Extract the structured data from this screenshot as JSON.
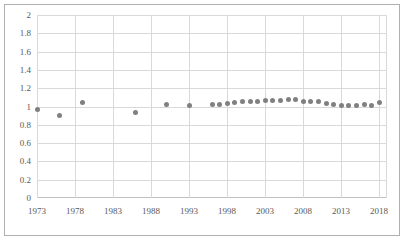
{
  "chart_data": {
    "type": "scatter",
    "title": "",
    "xlabel": "",
    "ylabel": "",
    "xlim": [
      1973,
      2019
    ],
    "ylim": [
      0,
      2
    ],
    "grid": true,
    "legend": "none",
    "marker_color": "#808080",
    "gridline_color": "#d9d9d9",
    "tick_label_color": "#595959",
    "frame_color": "#b0b0b0",
    "yticks": [
      "0",
      "0.2",
      "0.4",
      "0.6",
      "0.8",
      "1",
      "1.2",
      "1.4",
      "1.6",
      "1.8",
      "2"
    ],
    "ytick_values": [
      0,
      0.2,
      0.4,
      0.6,
      0.8,
      1.0,
      1.2,
      1.4,
      1.6,
      1.8,
      2.0
    ],
    "xticks": [
      "1973",
      "1978",
      "1983",
      "1988",
      "1993",
      "1998",
      "2003",
      "2008",
      "2013",
      "2018"
    ],
    "xtick_values": [
      1973,
      1978,
      1983,
      1988,
      1993,
      1998,
      2003,
      2008,
      2013,
      2018
    ],
    "series": [
      {
        "name": "series-1",
        "color": "#808080",
        "x": [
          1973,
          1976,
          1979,
          1986,
          1990,
          1993,
          1996,
          1997,
          1998,
          1999,
          2000,
          2001,
          2002,
          2003,
          2004,
          2005,
          2006,
          2007,
          2008,
          2009,
          2010,
          2011,
          2012,
          2013,
          2014,
          2015,
          2016,
          2017,
          2018
        ],
        "y": [
          0.97,
          0.9,
          1.04,
          0.93,
          1.02,
          1.01,
          1.02,
          1.02,
          1.03,
          1.04,
          1.05,
          1.05,
          1.06,
          1.07,
          1.07,
          1.07,
          1.08,
          1.08,
          1.06,
          1.05,
          1.05,
          1.03,
          1.02,
          1.01,
          1.01,
          1.01,
          1.02,
          1.01,
          1.04
        ]
      }
    ]
  }
}
